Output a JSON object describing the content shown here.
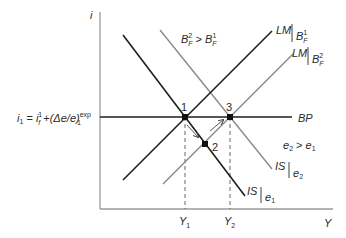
{
  "diagram": {
    "type": "IS-LM-BP",
    "axes": {
      "y_label": "i",
      "x_label": "Y"
    },
    "bp_label": {
      "lhs": "i",
      "lhs_sub": "1",
      "eq": " = ",
      "term1": "i",
      "term1_sup": "1",
      "term1_sub": "f",
      "plus": " +",
      "term2": "(Δe/e)",
      "term2_sup": "exp",
      "term2_sub": "1"
    },
    "curves": {
      "bp": {
        "label": "BP"
      },
      "lm1": {
        "label": "LM",
        "cond": "B",
        "cond_sup": "1",
        "cond_sub": "F"
      },
      "lm2": {
        "label": "LM",
        "cond": "B",
        "cond_sup": "2",
        "cond_sub": "F"
      },
      "is1": {
        "label": "IS",
        "cond": "e",
        "cond_sub": "1"
      },
      "is2": {
        "label": "IS",
        "cond": "e",
        "cond_sub": "2"
      }
    },
    "annotations": {
      "bf_compare": {
        "a": "B",
        "a_sup": "2",
        "a_sub": "F",
        "op": " > ",
        "b": "B",
        "b_sup": "1",
        "b_sub": "F"
      },
      "e_compare": {
        "a": "e",
        "a_sub": "2",
        "op": " > ",
        "b": "e",
        "b_sub": "1"
      }
    },
    "points": [
      {
        "id": "1",
        "label": "1"
      },
      {
        "id": "2",
        "label": "2"
      },
      {
        "id": "3",
        "label": "3"
      }
    ],
    "x_ticks": [
      {
        "label": "Y",
        "sub": "1"
      },
      {
        "label": "Y",
        "sub": "2"
      }
    ],
    "colors": {
      "dark_line": "#1e1e1e",
      "gray_line": "#8a8a8a",
      "axis": "#9a9a9a",
      "text": "#2a2a2a"
    }
  }
}
